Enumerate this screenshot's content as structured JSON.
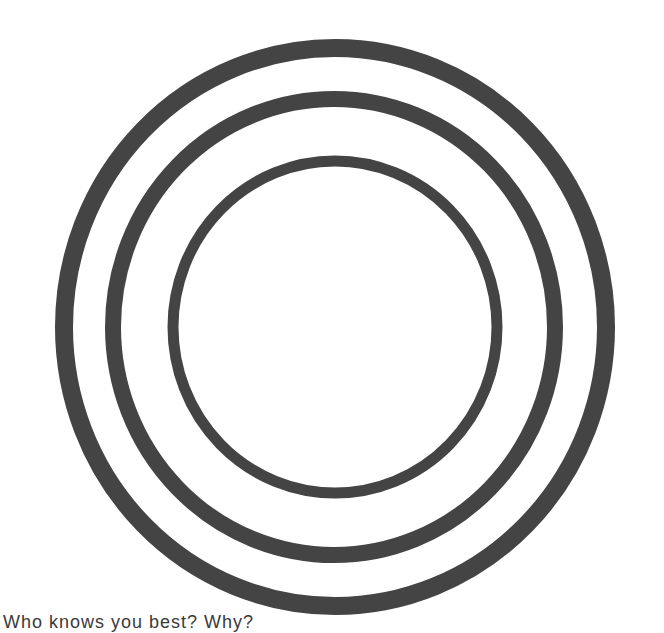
{
  "worksheet": {
    "prompt": "Who knows you best? Why?",
    "ring_color": "#444444",
    "text_color": "#3a3a3a",
    "background": "#ffffff"
  },
  "rings": [
    {
      "name": "outer-ring",
      "cx": 335,
      "cy": 327,
      "rx": 271,
      "ry": 279,
      "stroke_width": 18
    },
    {
      "name": "middle-ring",
      "cx": 334,
      "cy": 327,
      "rx": 221,
      "ry": 228,
      "stroke_width": 16
    },
    {
      "name": "inner-ring",
      "cx": 335,
      "cy": 327,
      "rx": 162,
      "ry": 166,
      "stroke_width": 11
    }
  ]
}
